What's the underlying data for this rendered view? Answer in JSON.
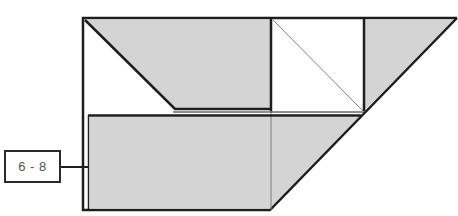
{
  "diagram": {
    "type": "shaded-geometric-figure",
    "colors": {
      "fill_shaded": "#d4d4d4",
      "fill_unshaded": "#ffffff",
      "stroke_main": "#1e1e1e",
      "stroke_thin": "#808080",
      "label_text": "#555555"
    },
    "label": {
      "text": "6 - 8"
    },
    "regions": [
      {
        "name": "top-left-trapezoid",
        "shaded": true
      },
      {
        "name": "top-left-triangle",
        "shaded": false
      },
      {
        "name": "top-middle-square",
        "shaded": false
      },
      {
        "name": "top-right-triangle",
        "shaded": true
      },
      {
        "name": "bottom-rectangle",
        "shaded": true
      },
      {
        "name": "bottom-right-triangle",
        "shaded": true
      }
    ]
  }
}
